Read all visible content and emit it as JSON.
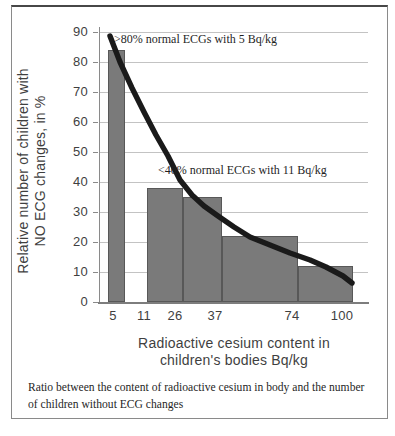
{
  "figure": {
    "caption_lines": [
      "Ratio between the content of radioactive cesium in body and the number",
      "of children without ECG changes"
    ]
  },
  "chart_data": {
    "type": "bar",
    "title": "",
    "xlabel_lines": [
      "Radioactive cesium content in",
      "children's bodies Bq/kg"
    ],
    "ylabel_lines": [
      "Relative number of children with",
      "NO ECG changes, in %"
    ],
    "ylim": [
      0,
      90
    ],
    "yticks": [
      0,
      10,
      20,
      30,
      40,
      50,
      60,
      70,
      80,
      90
    ],
    "xtick_labels": [
      "5",
      "11",
      "26",
      "37",
      "74",
      "100"
    ],
    "bars": [
      {
        "x_bin": "5",
        "value": 84
      },
      {
        "x_bin": "11-26",
        "value": 38
      },
      {
        "x_bin": "26-37",
        "value": 35
      },
      {
        "x_bin": "37-74",
        "value": 22
      },
      {
        "x_bin": "74-100",
        "value": 12
      }
    ],
    "trend_curve_points": [
      [
        5,
        86
      ],
      [
        11,
        63
      ],
      [
        26,
        44
      ],
      [
        37,
        29
      ],
      [
        74,
        16
      ],
      [
        100,
        9
      ]
    ],
    "annotations": [
      ">80% normal ECGs with 5 Bq/kg",
      "<40% normal ECGs with 11 Bq/kg"
    ],
    "grid": true,
    "legend": false,
    "colors": {
      "bar_fill": "#7a7a7a",
      "bar_border": "#585858",
      "curve": "#1a1a1a",
      "gridline": "#c3c3c3",
      "axis": "#8a8a8a",
      "tick_text": "#3f3f3f",
      "serif_text": "#1f1f1f",
      "box_border": "#8a8a8a"
    }
  },
  "layout": {
    "plot": {
      "left": 100,
      "top": 32,
      "width": 268,
      "height": 270,
      "px_per_unit": 3
    },
    "xtick_px": [
      13,
      44,
      75,
      115,
      192,
      242
    ],
    "bars_px": [
      {
        "left": 8,
        "width": 17
      },
      {
        "left": 47,
        "width": 36
      },
      {
        "left": 83,
        "width": 39
      },
      {
        "left": 122,
        "width": 76
      },
      {
        "left": 198,
        "width": 55
      }
    ],
    "curve_px": [
      [
        10,
        4
      ],
      [
        20,
        30
      ],
      [
        32,
        56
      ],
      [
        44,
        80
      ],
      [
        56,
        103
      ],
      [
        68,
        124
      ],
      [
        80,
        148
      ],
      [
        92,
        163
      ],
      [
        104,
        174
      ],
      [
        118,
        184
      ],
      [
        134,
        195
      ],
      [
        150,
        205
      ],
      [
        170,
        213
      ],
      [
        190,
        221
      ],
      [
        210,
        228
      ],
      [
        226,
        235
      ],
      [
        243,
        244
      ],
      [
        252,
        251
      ]
    ],
    "annotations_px": [
      {
        "left": 14,
        "top": 0
      },
      {
        "left": 58,
        "top": 131
      }
    ]
  }
}
